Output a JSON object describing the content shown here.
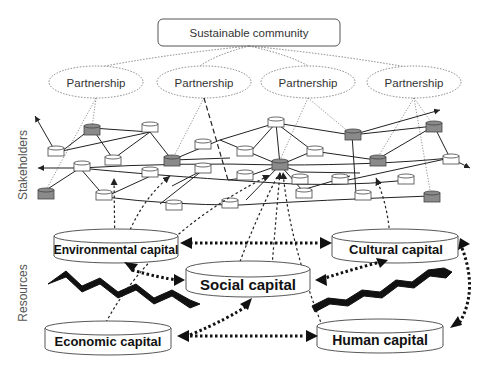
{
  "diagram": {
    "top_node": {
      "label": "Sustainable community"
    },
    "partnerships": [
      {
        "label": "Partnership"
      },
      {
        "label": "Partnership"
      },
      {
        "label": "Partnership"
      },
      {
        "label": "Partnership"
      }
    ],
    "side_labels": {
      "stakeholders": "Stakeholders",
      "resources": "Resources"
    },
    "capitals": [
      {
        "id": "environmental",
        "label": "Environmental capital"
      },
      {
        "id": "cultural",
        "label": "Cultural capital"
      },
      {
        "id": "social",
        "label": "Social capital"
      },
      {
        "id": "economic",
        "label": "Economic capital"
      },
      {
        "id": "human",
        "label": "Human capital"
      }
    ],
    "colors": {
      "line": "#222222",
      "dotted": "#777777",
      "node_fill": "#ffffff",
      "node_highlight": "#8a8a8a"
    }
  }
}
